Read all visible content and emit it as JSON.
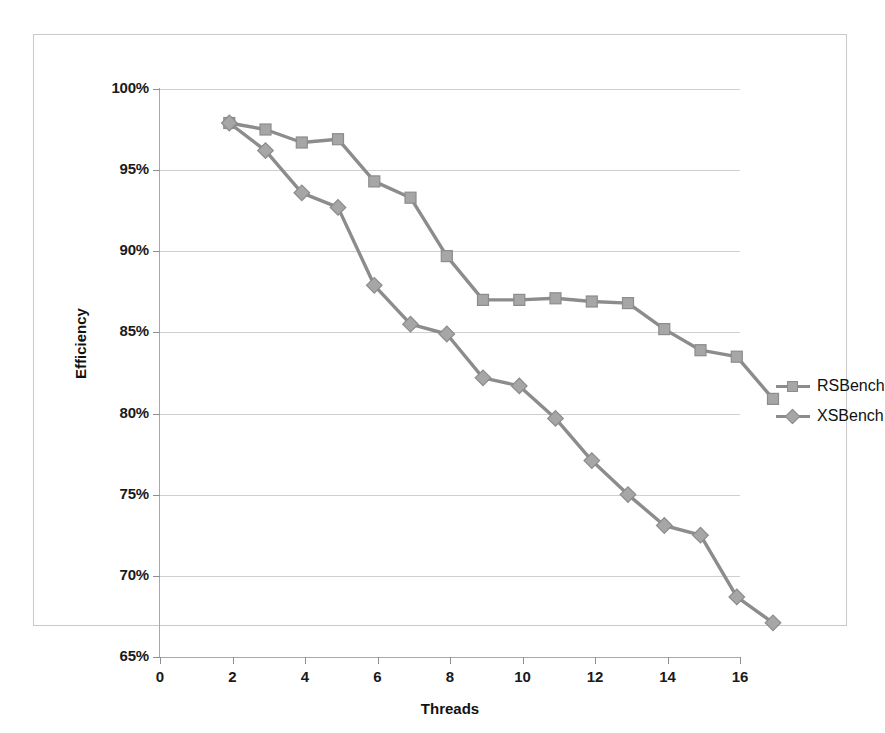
{
  "chart_data": {
    "type": "line",
    "title": "",
    "xlabel": "Threads",
    "ylabel": "Efficiency",
    "x": [
      1,
      2,
      3,
      4,
      5,
      6,
      7,
      8,
      9,
      10,
      11,
      12,
      13,
      14,
      15,
      16
    ],
    "xlim": [
      0,
      16
    ],
    "ylim": [
      65,
      100
    ],
    "xticks": [
      "0",
      "2",
      "4",
      "6",
      "8",
      "10",
      "12",
      "14",
      "16"
    ],
    "xtick_values": [
      0,
      2,
      4,
      6,
      8,
      10,
      12,
      14,
      16
    ],
    "yticks": [
      "65%",
      "70%",
      "75%",
      "80%",
      "85%",
      "90%",
      "95%",
      "100%"
    ],
    "ytick_values": [
      65,
      70,
      75,
      80,
      85,
      90,
      95,
      100
    ],
    "grid": "horizontal",
    "legend_position": "right",
    "series": [
      {
        "name": "RSBench",
        "marker": "square",
        "color": "#a6a6a6",
        "line_color": "#8c8c8c",
        "values": [
          100.0,
          99.6,
          98.8,
          99.0,
          96.4,
          95.4,
          91.8,
          89.1,
          89.1,
          89.2,
          89.0,
          88.9,
          87.3,
          86.0,
          85.6,
          83.0
        ]
      },
      {
        "name": "XSBench",
        "marker": "diamond",
        "color": "#a6a6a6",
        "line_color": "#8c8c8c",
        "values": [
          100.0,
          98.3,
          95.7,
          94.8,
          90.0,
          87.6,
          87.0,
          84.3,
          83.8,
          81.8,
          79.2,
          77.1,
          75.2,
          74.6,
          70.8,
          69.2
        ]
      }
    ]
  },
  "legend": {
    "items": [
      {
        "label": "RSBench",
        "marker": "square"
      },
      {
        "label": "XSBench",
        "marker": "diamond"
      }
    ]
  },
  "colors": {
    "series": "#a6a6a6",
    "line": "#8c8c8c",
    "grid": "#cfcfcf",
    "axis": "#a8a8a8",
    "text": "#111111",
    "frame": "#c9c9c9"
  }
}
